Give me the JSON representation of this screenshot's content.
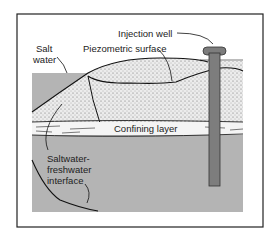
{
  "diagram": {
    "labels": {
      "injection_well": "Injection well",
      "piezometric_surface": "Piezometric surface",
      "salt_water_line1": "Salt",
      "salt_water_line2": "water",
      "confining_layer": "Confining layer",
      "interface_line1": "Saltwater-",
      "interface_line2": "freshwater",
      "interface_line3": "interface"
    },
    "colors": {
      "salt_water": "#b4b4b4",
      "fresh_water_aquifer": "#e6e6e6",
      "well": "#7d7d7d",
      "outline": "#111111",
      "confining_layer": "#f4f4f4"
    }
  }
}
